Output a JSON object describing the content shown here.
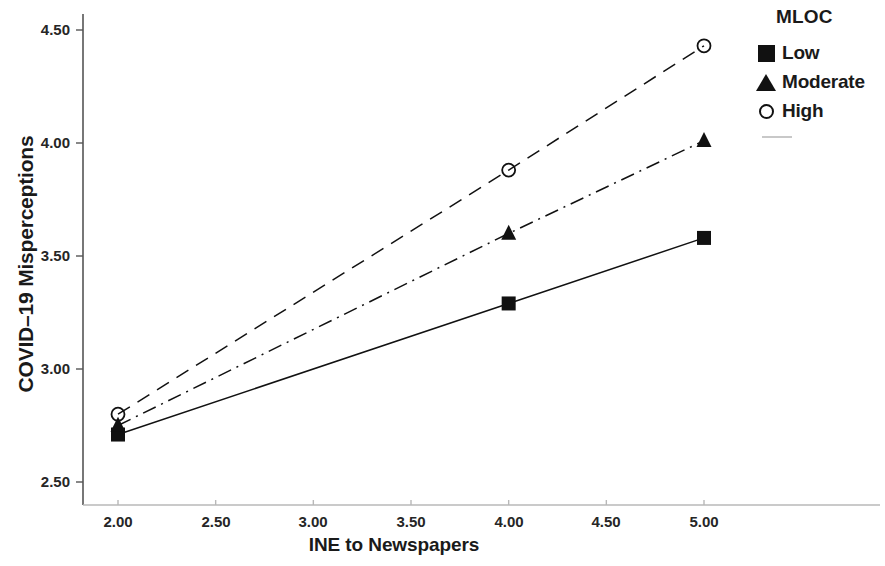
{
  "chart_data": {
    "type": "line",
    "title": "",
    "xlabel": "INE to Newspapers",
    "ylabel": "COVID–19 Misperceptions",
    "xlim": [
      2.0,
      5.0
    ],
    "ylim": [
      2.5,
      4.5
    ],
    "x_ticks": [
      "2.00",
      "2.50",
      "3.00",
      "3.50",
      "4.00",
      "4.50",
      "5.00"
    ],
    "x_tick_values": [
      2.0,
      2.5,
      3.0,
      3.5,
      4.0,
      4.5,
      5.0
    ],
    "y_ticks": [
      "2.50",
      "3.00",
      "3.50",
      "4.00",
      "4.50"
    ],
    "y_tick_values": [
      2.5,
      3.0,
      3.5,
      4.0,
      4.5
    ],
    "grid": false,
    "legend_position": "top-right",
    "legend_title": "MLOC",
    "x": [
      2.0,
      4.0,
      5.0
    ],
    "series": [
      {
        "name": "Low",
        "marker": "filled-square",
        "line_style": "solid",
        "color": "#111111",
        "values": [
          2.71,
          3.29,
          3.58
        ]
      },
      {
        "name": "Moderate",
        "marker": "filled-triangle",
        "line_style": "dash-dot",
        "color": "#111111",
        "values": [
          2.75,
          3.6,
          4.01
        ]
      },
      {
        "name": "High",
        "marker": "open-circle",
        "line_style": "dashed",
        "color": "#111111",
        "values": [
          2.8,
          3.88,
          4.43
        ]
      }
    ]
  },
  "axes": {
    "y_title": "COVID–19 Misperceptions",
    "x_title": "INE to Newspapers",
    "y_labels": [
      "4.50",
      "4.00",
      "3.50",
      "3.00",
      "2.50"
    ],
    "x_labels": [
      "2.00",
      "2.50",
      "3.00",
      "3.50",
      "4.00",
      "4.50",
      "5.00"
    ]
  },
  "legend": {
    "title": "MLOC",
    "items": [
      {
        "label": "Low",
        "marker": "filled-square-icon"
      },
      {
        "label": "Moderate",
        "marker": "filled-triangle-icon"
      },
      {
        "label": "High",
        "marker": "open-circle-icon"
      }
    ]
  },
  "colors": {
    "ink": "#111111",
    "axis": "#555555",
    "line_faint": "#b8b8b8",
    "background": "#ffffff"
  }
}
